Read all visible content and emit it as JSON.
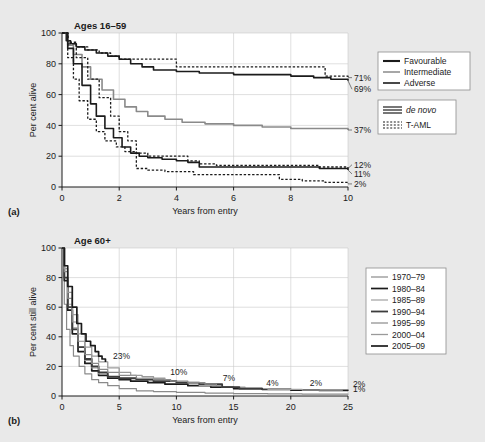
{
  "figure": {
    "background_color": "#e9e9e9",
    "plot_background_color": "#ffffff"
  },
  "panel_a": {
    "letter": "(a)",
    "title": "Ages 16–59",
    "ylabel": "Per cent alive",
    "xlabel": "Years from entry",
    "yticks": [
      "0",
      "20",
      "40",
      "60",
      "80",
      "100"
    ],
    "xticks": [
      "0",
      "2",
      "4",
      "6",
      "8",
      "10"
    ],
    "end_labels": [
      "71%",
      "69%",
      "37%",
      "12%",
      "11%",
      "2%"
    ],
    "legend_risk": {
      "items": [
        {
          "label": "Favourable",
          "color": "#1b1b1b",
          "width": 2.1,
          "dash": "none"
        },
        {
          "label": "Intermediate",
          "color": "#8a8a8a",
          "width": 1.5,
          "dash": "none"
        },
        {
          "label": "Adverse",
          "color": "#1b1b1b",
          "width": 1.6,
          "dash": "none"
        }
      ]
    },
    "legend_type": {
      "items": [
        {
          "label": "de novo",
          "style": "solid",
          "italic": true
        },
        {
          "label": "T-AML",
          "style": "dotted",
          "italic": false
        }
      ]
    }
  },
  "panel_b": {
    "letter": "(b)",
    "title": "Age 60+",
    "ylabel": "Per cent still alive",
    "xlabel": "Years from entry",
    "yticks": [
      "0",
      "20",
      "40",
      "60",
      "80",
      "100"
    ],
    "xticks": [
      "0",
      "5",
      "10",
      "15",
      "20",
      "25"
    ],
    "annotations": [
      "23%",
      "10%",
      "7%",
      "4%",
      "2%",
      "2%",
      "1%"
    ],
    "legend": {
      "items": [
        {
          "label": "1970–79",
          "color": "#8a8a8a",
          "width": 1.2
        },
        {
          "label": "1980–84",
          "color": "#1b1b1b",
          "width": 1.7
        },
        {
          "label": "1985–89",
          "color": "#a0a0a0",
          "width": 1.2
        },
        {
          "label": "1990–94",
          "color": "#3c3c3c",
          "width": 1.8
        },
        {
          "label": "1995–99",
          "color": "#8a8a8a",
          "width": 1.2
        },
        {
          "label": "2000–04",
          "color": "#9a9a9a",
          "width": 1.3
        },
        {
          "label": "2005–09",
          "color": "#1b1b1b",
          "width": 1.7
        }
      ]
    }
  },
  "chart_data": [
    {
      "type": "line",
      "title": "Ages 16–59",
      "xlabel": "Years from entry",
      "ylabel": "Per cent alive",
      "xlim": [
        0,
        10
      ],
      "ylim": [
        0,
        100
      ],
      "xticks": [
        0,
        2,
        4,
        6,
        8,
        10
      ],
      "yticks": [
        0,
        20,
        40,
        60,
        80,
        100
      ],
      "grid": true,
      "legend_position": "right",
      "series": [
        {
          "name": "Favourable de novo",
          "group": "de novo",
          "risk": "Favourable",
          "style": "solid",
          "color": "#1b1b1b",
          "endpoint_label": "69%",
          "x": [
            0,
            0.15,
            0.3,
            0.5,
            0.8,
            1.2,
            1.6,
            2.0,
            2.4,
            2.8,
            3.2,
            4.0,
            4.8,
            5.4,
            6.0,
            7.0,
            8.0,
            8.8,
            9.4,
            10.0
          ],
          "y": [
            100,
            95,
            93,
            91,
            89,
            87,
            85,
            83,
            80,
            78,
            76,
            75,
            74,
            74,
            73,
            73,
            72,
            71,
            70,
            69
          ]
        },
        {
          "name": "Favourable T-AML",
          "group": "T-AML",
          "risk": "Favourable",
          "style": "dotted",
          "color": "#1b1b1b",
          "endpoint_label": "71%",
          "x": [
            0,
            0.2,
            0.5,
            0.9,
            1.3,
            1.7,
            2.0,
            2.6,
            3.0,
            4.0,
            5.0,
            6.0,
            7.0,
            8.0,
            8.8,
            9.2,
            10.0
          ],
          "y": [
            100,
            94,
            91,
            89,
            87,
            85,
            83,
            83,
            83,
            78,
            78,
            78,
            78,
            78,
            78,
            72,
            71
          ]
        },
        {
          "name": "Intermediate de novo",
          "group": "de novo",
          "risk": "Intermediate",
          "style": "solid",
          "color": "#8a8a8a",
          "endpoint_label": "37%",
          "x": [
            0,
            0.2,
            0.4,
            0.7,
            1.0,
            1.4,
            1.8,
            2.2,
            2.6,
            3.0,
            3.6,
            4.2,
            5.0,
            6.0,
            7.0,
            8.0,
            9.0,
            10.0
          ],
          "y": [
            100,
            92,
            86,
            78,
            70,
            63,
            57,
            52,
            49,
            46,
            44,
            42,
            41,
            40,
            39,
            38,
            38,
            37
          ]
        },
        {
          "name": "Adverse de novo",
          "group": "de novo",
          "risk": "Adverse",
          "style": "solid",
          "color": "#1b1b1b",
          "endpoint_label": "11%",
          "x": [
            0,
            0.2,
            0.4,
            0.7,
            1.0,
            1.2,
            1.5,
            1.8,
            2.1,
            2.4,
            2.7,
            3.0,
            3.5,
            4.0,
            4.4,
            4.8,
            5.4,
            6.0,
            7.0,
            8.0,
            9.0,
            10.0
          ],
          "y": [
            100,
            90,
            80,
            66,
            54,
            46,
            38,
            32,
            26,
            22,
            20,
            19,
            18,
            17,
            16,
            13,
            13,
            13,
            13,
            13,
            12,
            11
          ]
        },
        {
          "name": "Adverse T-AML",
          "group": "T-AML",
          "risk": "Adverse",
          "style": "dotted",
          "color": "#1b1b1b",
          "endpoint_label": "12%",
          "x": [
            0,
            0.2,
            0.5,
            0.9,
            1.3,
            1.7,
            2.0,
            2.3,
            2.6,
            3.0,
            3.6,
            4.0,
            4.4,
            4.8,
            5.4,
            6.0,
            7.0,
            8.0,
            9.0,
            10.0
          ],
          "y": [
            100,
            93,
            84,
            70,
            58,
            46,
            36,
            30,
            22,
            20,
            20,
            20,
            17,
            15,
            14,
            14,
            14,
            14,
            13,
            12
          ]
        },
        {
          "name": "Intermediate T-AML",
          "group": "T-AML",
          "risk": "Intermediate",
          "style": "dotted",
          "color": "#1b1b1b",
          "endpoint_label": "2%",
          "x": [
            0,
            0.2,
            0.4,
            0.6,
            0.9,
            1.2,
            1.5,
            1.9,
            2.2,
            2.6,
            3.0,
            3.6,
            4.0,
            4.6,
            5.4,
            6.2,
            7.0,
            7.6,
            8.4,
            9.2,
            10.0
          ],
          "y": [
            100,
            84,
            70,
            56,
            44,
            36,
            30,
            26,
            23,
            12,
            11,
            10,
            10,
            8,
            8,
            8,
            8,
            5,
            4,
            3,
            2
          ]
        }
      ]
    },
    {
      "type": "line",
      "title": "Age 60+",
      "xlabel": "Years from entry",
      "ylabel": "Per cent still alive",
      "xlim": [
        0,
        25
      ],
      "ylim": [
        0,
        100
      ],
      "xticks": [
        0,
        5,
        10,
        15,
        20,
        25
      ],
      "yticks": [
        0,
        20,
        40,
        60,
        80,
        100
      ],
      "grid": true,
      "legend_position": "right",
      "annotations": [
        {
          "text": "23%",
          "x": 4.2,
          "y": 23
        },
        {
          "text": "10%",
          "x": 9.2,
          "y": 12
        },
        {
          "text": "7%",
          "x": 13.8,
          "y": 8
        },
        {
          "text": "4%",
          "x": 17.6,
          "y": 5
        },
        {
          "text": "2%",
          "x": 21.4,
          "y": 5
        },
        {
          "text": "2%",
          "x": 25.0,
          "y": 4
        },
        {
          "text": "1%",
          "x": 25.0,
          "y": 1
        }
      ],
      "series": [
        {
          "name": "1970–79",
          "color": "#8a8a8a",
          "width": 1.2,
          "endpoint_label": "1%",
          "x": [
            0,
            0.2,
            0.4,
            0.7,
            1.0,
            1.5,
            2.0,
            2.6,
            3.2,
            4.0,
            5.0,
            6.5,
            8.0,
            10.0,
            12.5,
            15.0,
            18.0,
            21.0,
            25.0
          ],
          "y": [
            100,
            62,
            45,
            34,
            27,
            20,
            15,
            11,
            9,
            7,
            5,
            3.5,
            3,
            2.5,
            2,
            1.6,
            1.4,
            1.2,
            1
          ]
        },
        {
          "name": "1980–84",
          "color": "#1b1b1b",
          "width": 1.7,
          "endpoint_label": "2%",
          "x": [
            0,
            0.2,
            0.5,
            0.9,
            1.4,
            2.0,
            2.6,
            3.2,
            4.0,
            5.0,
            6.0,
            7.5,
            9.0,
            11.0,
            13.0,
            15.0,
            17.5,
            20.0,
            22.5,
            25.0
          ],
          "y": [
            100,
            78,
            58,
            42,
            30,
            22,
            17,
            14,
            12,
            11,
            10,
            9,
            8,
            7,
            6,
            5,
            4.5,
            4,
            3.8,
            3.5
          ]
        },
        {
          "name": "1985–89",
          "color": "#a0a0a0",
          "width": 1.2,
          "endpoint_label": "2%",
          "x": [
            0,
            0.2,
            0.5,
            0.9,
            1.4,
            2.0,
            2.6,
            3.2,
            4.0,
            5.0,
            6.5,
            8.0,
            10.0,
            12.0,
            14.0,
            16.0,
            18.0,
            21.0,
            24.5
          ],
          "y": [
            100,
            80,
            62,
            46,
            33,
            24,
            19,
            15,
            13,
            12,
            11,
            10,
            9,
            7,
            6,
            5,
            4.5,
            4,
            3.6
          ]
        },
        {
          "name": "1990–94",
          "color": "#3c3c3c",
          "width": 1.8,
          "endpoint_label": "4%",
          "x": [
            0,
            0.2,
            0.5,
            0.9,
            1.4,
            2.0,
            2.6,
            3.2,
            4.0,
            5.0,
            6.5,
            8.0,
            10.0,
            12.0,
            14.0,
            15.5,
            17.5
          ],
          "y": [
            100,
            80,
            60,
            45,
            33,
            25,
            20,
            16,
            13,
            12,
            11,
            10,
            9,
            8,
            6,
            5,
            4
          ]
        },
        {
          "name": "1995–99",
          "color": "#8a8a8a",
          "width": 1.2,
          "endpoint_label": "7%",
          "x": [
            0,
            0.2,
            0.5,
            0.9,
            1.4,
            2.0,
            2.6,
            3.2,
            4.0,
            5.0,
            6.5,
            8.0,
            9.5,
            11.0,
            12.5,
            13.5
          ],
          "y": [
            100,
            84,
            66,
            50,
            37,
            28,
            22,
            18,
            16,
            14,
            12,
            11,
            10,
            9,
            8,
            7
          ]
        },
        {
          "name": "2000–04",
          "color": "#9a9a9a",
          "width": 1.3,
          "endpoint_label": "10%",
          "x": [
            0,
            0.2,
            0.5,
            0.9,
            1.4,
            2.0,
            2.6,
            3.2,
            4.0,
            5.0,
            6.0,
            7.0,
            8.0,
            9.0
          ],
          "y": [
            100,
            86,
            70,
            55,
            42,
            33,
            27,
            23,
            19,
            16,
            14,
            13,
            12,
            11
          ]
        },
        {
          "name": "2005–09",
          "color": "#1b1b1b",
          "width": 1.7,
          "endpoint_label": "23%",
          "x": [
            0,
            0.2,
            0.5,
            0.9,
            1.3,
            1.7,
            2.1,
            2.5,
            2.9,
            3.2,
            3.5,
            3.8
          ],
          "y": [
            100,
            88,
            74,
            60,
            49,
            42,
            37,
            34,
            30,
            27,
            25,
            23
          ]
        }
      ]
    }
  ]
}
